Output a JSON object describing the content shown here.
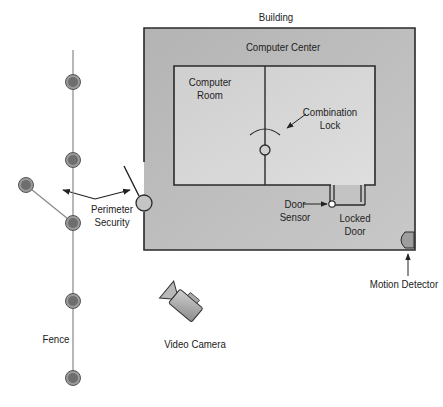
{
  "diagram": {
    "type": "physical-security-layout",
    "labels": {
      "building": "Building",
      "computer_center": "Computer Center",
      "computer_room_line1": "Computer",
      "computer_room_line2": "Room",
      "combination_lock_line1": "Combination",
      "combination_lock_line2": "Lock",
      "door_sensor_line1": "Door",
      "door_sensor_line2": "Sensor",
      "locked_door_line1": "Locked",
      "locked_door_line2": "Door",
      "perimeter_security_line1": "Perimeter",
      "perimeter_security_line2": "Security",
      "motion_detector": "Motion Detector",
      "video_camera": "Video Camera",
      "fence": "Fence"
    },
    "colors": {
      "building_fill": "#bdbdbd",
      "room_fill": "#d6d6d6",
      "stroke": "#2a2a2a",
      "post_fill": "#808080",
      "post_ring": "#a0a0a0"
    },
    "fence_posts": [
      {
        "x": 73,
        "y": 82
      },
      {
        "x": 73,
        "y": 160
      },
      {
        "x": 26,
        "y": 185
      },
      {
        "x": 73,
        "y": 223
      },
      {
        "x": 73,
        "y": 301
      },
      {
        "x": 73,
        "y": 378
      }
    ]
  }
}
